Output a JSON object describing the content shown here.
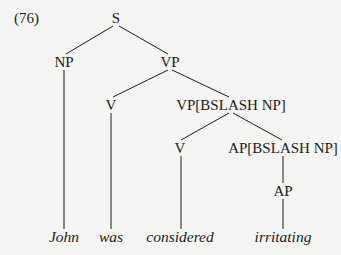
{
  "example_number": "(76)",
  "tree": {
    "nodes": {
      "s": {
        "label": "S",
        "x": 116,
        "y": 18
      },
      "np": {
        "label": "NP",
        "x": 64,
        "y": 62
      },
      "vp": {
        "label": "VP",
        "x": 170,
        "y": 62
      },
      "v1": {
        "label": "V",
        "x": 111,
        "y": 105
      },
      "vp_slash": {
        "label": "VP[BSLASH NP]",
        "x": 231,
        "y": 105
      },
      "v2": {
        "label": "V",
        "x": 180,
        "y": 148
      },
      "ap_slash": {
        "label": "AP[BSLASH NP]",
        "x": 283,
        "y": 148
      },
      "ap": {
        "label": "AP",
        "x": 283,
        "y": 191
      }
    },
    "leaves": {
      "john": {
        "label": "John",
        "x": 64,
        "y": 237
      },
      "was": {
        "label": "was",
        "x": 111,
        "y": 237
      },
      "considered": {
        "label": "considered",
        "x": 180,
        "y": 237
      },
      "irritating": {
        "label": "irritating",
        "x": 283,
        "y": 237
      }
    },
    "edges": [
      [
        "s",
        "np"
      ],
      [
        "s",
        "vp"
      ],
      [
        "np",
        "john"
      ],
      [
        "vp",
        "v1"
      ],
      [
        "vp",
        "vp_slash"
      ],
      [
        "v1",
        "was"
      ],
      [
        "vp_slash",
        "v2"
      ],
      [
        "vp_slash",
        "ap_slash"
      ],
      [
        "v2",
        "considered"
      ],
      [
        "ap_slash",
        "ap"
      ],
      [
        "ap",
        "irritating"
      ]
    ]
  },
  "colors": {
    "ink": "#1c1c1c",
    "background": "#f4f4f2"
  }
}
